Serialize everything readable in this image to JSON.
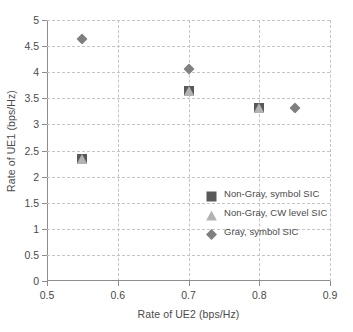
{
  "chart_data": {
    "type": "scatter",
    "title": "",
    "xlabel": "Rate of UE2 (bps/Hz)",
    "ylabel": "Rate of UE1 (bps/Hz)",
    "xlim": [
      0.5,
      0.9
    ],
    "ylim": [
      0,
      5
    ],
    "xticks": [
      "0.5",
      "0.6",
      "0.7",
      "0.8",
      "0.9"
    ],
    "xtick_values": [
      0.5,
      0.6,
      0.7,
      0.8,
      0.9
    ],
    "yticks": [
      "0",
      "0.5",
      "1",
      "1.5",
      "2",
      "2.5",
      "3",
      "3.5",
      "4",
      "4.5",
      "5"
    ],
    "ytick_values": [
      0,
      0.5,
      1,
      1.5,
      2,
      2.5,
      3,
      3.5,
      4,
      4.5,
      5
    ],
    "grid": true,
    "legend_position": "inside-lower-right",
    "series": [
      {
        "name": "Non-Gray, symbol SIC",
        "marker": "square",
        "color": "#595959",
        "points": [
          {
            "x": 0.55,
            "y": 2.4
          },
          {
            "x": 0.7,
            "y": 3.7
          },
          {
            "x": 0.8,
            "y": 3.38
          }
        ]
      },
      {
        "name": "Non-Gray, CW level SIC",
        "marker": "triangle",
        "color": "#b3b3b3",
        "points": [
          {
            "x": 0.55,
            "y": 2.4
          },
          {
            "x": 0.7,
            "y": 3.7
          },
          {
            "x": 0.8,
            "y": 3.38
          }
        ]
      },
      {
        "name": "Gray, symbol SIC",
        "marker": "diamond",
        "color": "#7f7f7f",
        "points": [
          {
            "x": 0.55,
            "y": 4.7
          },
          {
            "x": 0.7,
            "y": 4.12
          },
          {
            "x": 0.85,
            "y": 3.38
          }
        ]
      }
    ]
  },
  "legend": {
    "entries": [
      {
        "label": "Non-Gray, symbol SIC",
        "marker": "square",
        "color": "#595959"
      },
      {
        "label": "Non-Gray, CW level SIC",
        "marker": "triangle",
        "color": "#b3b3b3"
      },
      {
        "label": "Gray, symbol SIC",
        "marker": "diamond",
        "color": "#7f7f7f"
      }
    ]
  },
  "colors": {
    "axis": "#8d8d8d",
    "grid": "#c4c4c4",
    "text": "#4a4a4a",
    "background": "#ffffff"
  }
}
